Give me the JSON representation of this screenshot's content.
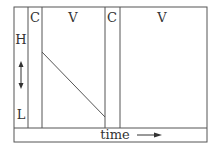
{
  "diagram": {
    "columns": [
      {
        "label": "",
        "role": "axis-column"
      },
      {
        "label": "C"
      },
      {
        "label": "V"
      },
      {
        "label": "C"
      },
      {
        "label": "V"
      }
    ],
    "axis": {
      "top_label": "H",
      "bottom_label": "L",
      "arrow": "double-vertical-arrow"
    },
    "time_bar": {
      "label": "time",
      "arrow": "right-arrow"
    },
    "line": {
      "description": "diagonal line descending from upper-left to lower-right in first V column"
    },
    "colors": {
      "stroke": "#555555",
      "text": "#333333",
      "background": "#ffffff"
    }
  }
}
